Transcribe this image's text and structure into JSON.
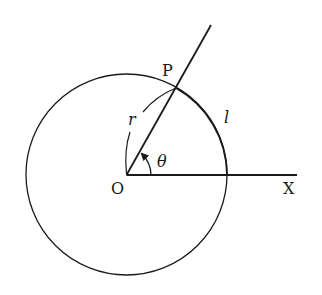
{
  "diagram": {
    "type": "polar-coordinates-circle",
    "colors": {
      "stroke": "#1a1a1a",
      "background": "#ffffff"
    },
    "labels": {
      "point_p": "P",
      "origin": "O",
      "axis_x": "X",
      "radius": "r",
      "arc_length": "l",
      "angle": "θ"
    },
    "geometry": {
      "center": [
        126.5,
        174.5
      ],
      "radius": 100,
      "ray_end": [
        211,
        25
      ],
      "axis_end": [
        297,
        175
      ],
      "point_p": [
        176,
        88
      ]
    }
  }
}
